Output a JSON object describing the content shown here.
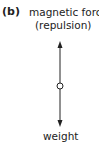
{
  "part_label": "(b)",
  "forces": {
    "up": {
      "label_line1": "magnetic force",
      "label_line2": "(repulsion)"
    },
    "down": {
      "label": "weight"
    }
  },
  "colors": {
    "line": "#222222",
    "text": "#222222"
  }
}
